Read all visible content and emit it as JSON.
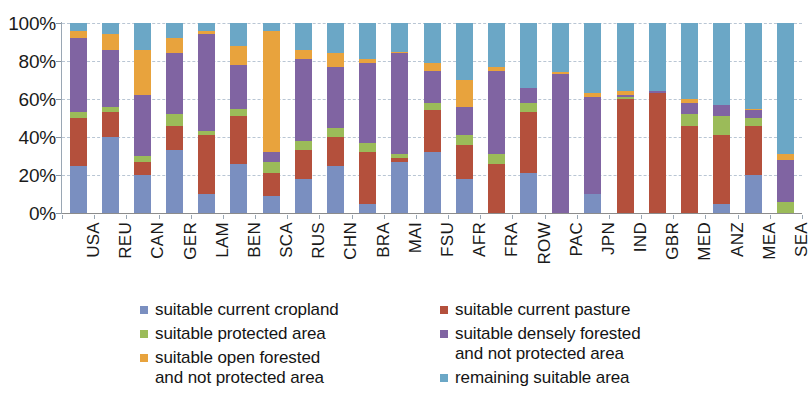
{
  "chart_data": {
    "type": "bar",
    "subtype": "stacked-percent",
    "title": "",
    "xlabel": "",
    "ylabel": "",
    "ylim": [
      0,
      100
    ],
    "ytick_labels": [
      "0%",
      "20%",
      "40%",
      "60%",
      "80%",
      "100%"
    ],
    "ytick_values": [
      0,
      20,
      40,
      60,
      80,
      100
    ],
    "grid": true,
    "grid_axis": "y",
    "legend_position": "bottom",
    "stack_order_bottom_to_top": [
      "suitable current cropland",
      "suitable current pasture",
      "suitable protected area",
      "suitable densely forested and not protected area",
      "suitable open forested and not protected area",
      "remaining suitable area"
    ],
    "categories": [
      "USA",
      "REU",
      "CAN",
      "GER",
      "LAM",
      "BEN",
      "SCA",
      "RUS",
      "CHN",
      "BRA",
      "MAI",
      "FSU",
      "AFR",
      "FRA",
      "ROW",
      "PAC",
      "JPN",
      "IND",
      "GBR",
      "MED",
      "ANZ",
      "MEA",
      "SEA"
    ],
    "series": [
      {
        "name": "suitable current cropland",
        "color": "#7a8fc0",
        "values": [
          25,
          40,
          20,
          33,
          10,
          26,
          9,
          18,
          25,
          5,
          27,
          32,
          18,
          0,
          21,
          0,
          10,
          0,
          0,
          0,
          5,
          20,
          0
        ]
      },
      {
        "name": "suitable current pasture",
        "color": "#b4503c",
        "values": [
          25,
          13,
          7,
          13,
          31,
          25,
          12,
          15,
          15,
          27,
          2,
          22,
          18,
          26,
          32,
          0,
          0,
          60,
          63,
          46,
          36,
          26,
          0
        ]
      },
      {
        "name": "suitable protected area",
        "color": "#9bbb59",
        "values": [
          3,
          3,
          3,
          6,
          2,
          4,
          6,
          5,
          5,
          5,
          2,
          4,
          5,
          5,
          5,
          0,
          0,
          1,
          0,
          6,
          10,
          4,
          6
        ]
      },
      {
        "name": "suitable densely forested and not protected area",
        "color": "#8064a2",
        "values": [
          39,
          30,
          32,
          32,
          51,
          23,
          5,
          43,
          32,
          42,
          53,
          17,
          15,
          44,
          8,
          73,
          51,
          1,
          1,
          6,
          6,
          4,
          22
        ]
      },
      {
        "name": "suitable open forested and not protected area",
        "color": "#e8a33d",
        "values": [
          4,
          8,
          24,
          8,
          2,
          10,
          64,
          5,
          7,
          2,
          1,
          4,
          14,
          2,
          0,
          1,
          2,
          2,
          0,
          2,
          0,
          1,
          3
        ]
      },
      {
        "name": "remaining suitable area",
        "color": "#6ba7c6",
        "values": [
          4,
          6,
          14,
          8,
          4,
          12,
          4,
          14,
          16,
          19,
          15,
          21,
          30,
          23,
          34,
          26,
          37,
          36,
          36,
          40,
          43,
          45,
          69
        ]
      }
    ]
  },
  "axis": {
    "y_labels": [
      "100%",
      "80%",
      "60%",
      "40%",
      "20%",
      "0%"
    ]
  },
  "legend": {
    "items": [
      {
        "label": "suitable current cropland",
        "label_line2": "",
        "color": "#7a8fc0",
        "column": "left"
      },
      {
        "label": "suitable protected area",
        "label_line2": "",
        "color": "#9bbb59",
        "column": "left"
      },
      {
        "label": "suitable open forested",
        "label_line2": "and not protected area",
        "color": "#e8a33d",
        "column": "left"
      },
      {
        "label": "suitable current pasture",
        "label_line2": "",
        "color": "#b4503c",
        "column": "right"
      },
      {
        "label": "suitable densely forested",
        "label_line2": "and not protected area",
        "color": "#8064a2",
        "column": "right"
      },
      {
        "label": "remaining suitable area",
        "label_line2": "",
        "color": "#6ba7c6",
        "column": "right"
      }
    ]
  }
}
